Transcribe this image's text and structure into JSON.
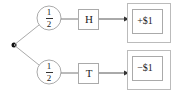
{
  "diagram": {
    "type": "probability-tree",
    "root": {
      "label": ""
    },
    "branches": [
      {
        "probability": {
          "numerator": "1",
          "denominator": "2"
        },
        "outcome": "H",
        "payoff": "+$1"
      },
      {
        "probability": {
          "numerator": "1",
          "denominator": "2"
        },
        "outcome": "T",
        "payoff": "−$1"
      }
    ],
    "colors": {
      "line": "#aaaaaa",
      "stroke": "#999999",
      "text": "#222222",
      "dot": "#111111",
      "arrow": "#444444"
    }
  }
}
